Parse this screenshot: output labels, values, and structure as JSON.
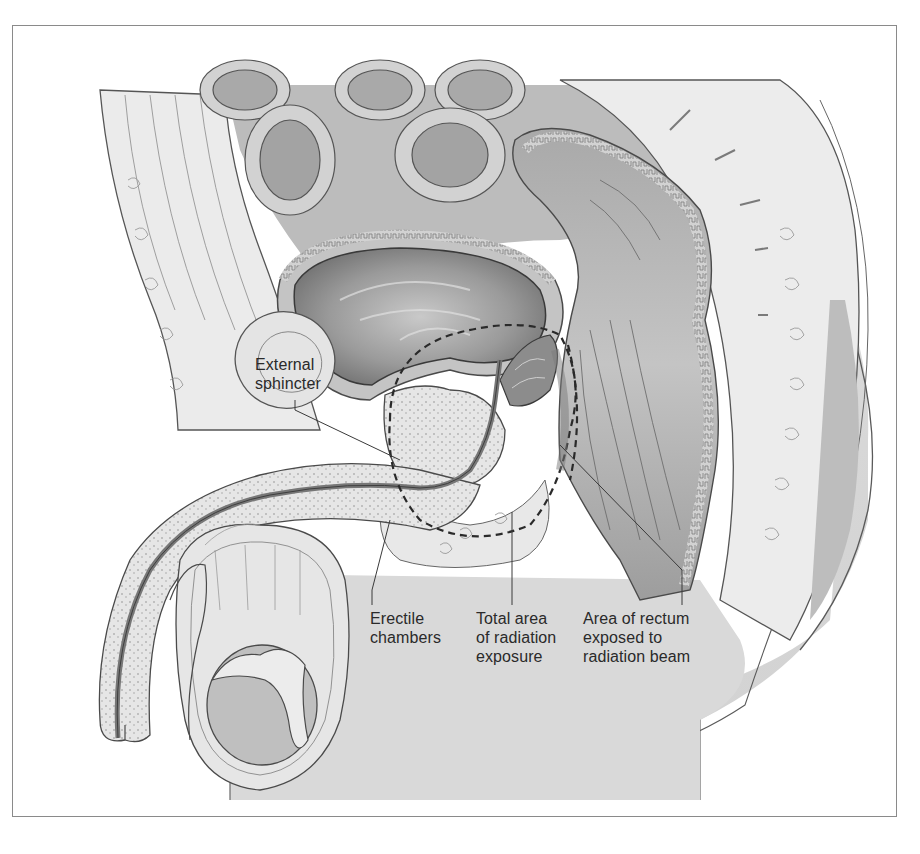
{
  "figure": {
    "colors": {
      "frame_border": "#8a8a8a",
      "background": "#ffffff",
      "skin_fill": "#d6d6d6",
      "tissue_light": "#ececec",
      "tissue_mid": "#bdbdbd",
      "tissue_dark": "#8c8c8c",
      "outline": "#4a4a4a",
      "label_text": "#2a2a2a"
    },
    "labels": {
      "external_sphincter": {
        "line1": "External",
        "line2": "sphincter"
      },
      "erectile_chambers": {
        "line1": "Erectile",
        "line2": "chambers"
      },
      "total_area": {
        "line1": "Total area",
        "line2": "of radiation",
        "line3": "exposure"
      },
      "rectum_area": {
        "line1": "Area of rectum",
        "line2": "exposed to",
        "line3": "radiation beam"
      }
    },
    "annotations": {
      "radiation_zone": "dashed-outline",
      "rectum_exposure": "dashed-outline"
    }
  }
}
